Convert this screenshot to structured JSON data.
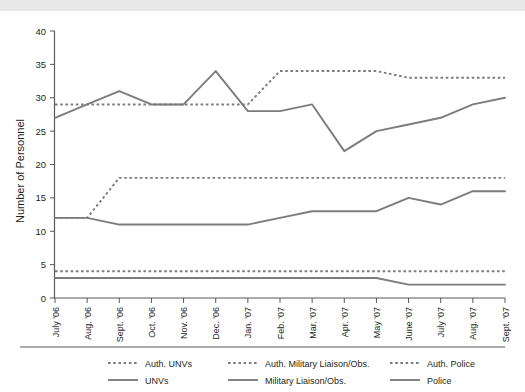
{
  "figure": {
    "background_color": "#ffffff",
    "top_strip_color": "#e8e8e8",
    "line_color": "#7b7c7e",
    "axis_color": "#58595b",
    "text_color": "#231f20"
  },
  "chart_data": {
    "type": "line",
    "title": "",
    "subtitle": "",
    "xlabel": "",
    "ylabel": "Number of Personnel",
    "ylim": [
      0,
      40
    ],
    "ytick_step": 5,
    "yticks": [
      "0",
      "5",
      "10",
      "15",
      "20",
      "25",
      "30",
      "35",
      "40"
    ],
    "grid": false,
    "legend_position": "bottom",
    "categories": [
      "July '06",
      "Aug. '06",
      "Sept. '06",
      "Oct. '06",
      "Nov. '06",
      "Dec. '06",
      "Jan. '07",
      "Feb. '07",
      "Mar. '07",
      "Apr. '07",
      "May '07",
      "June '07",
      "July '07",
      "Aug. '07",
      "Sept. '07"
    ],
    "series": [
      {
        "name": "Auth. UNVs",
        "style": "dashed",
        "values": [
          12,
          12,
          18,
          18,
          18,
          18,
          18,
          18,
          18,
          18,
          18,
          18,
          18,
          18,
          18
        ]
      },
      {
        "name": "Auth. Military Liaison/Obs.",
        "style": "dashed",
        "values": [
          29,
          29,
          29,
          29,
          29,
          29,
          29,
          34,
          34,
          34,
          34,
          33,
          33,
          33,
          33
        ]
      },
      {
        "name": "Auth. Police",
        "style": "dashed",
        "values": [
          4,
          4,
          4,
          4,
          4,
          4,
          4,
          4,
          4,
          4,
          4,
          4,
          4,
          4,
          4
        ]
      },
      {
        "name": "UNVs",
        "style": "solid",
        "values": [
          12,
          12,
          11,
          11,
          11,
          11,
          11,
          12,
          13,
          13,
          13,
          15,
          14,
          16,
          16
        ]
      },
      {
        "name": "Military Liaison/Obs.",
        "style": "solid",
        "values": [
          27,
          29,
          31,
          29,
          29,
          34,
          28,
          28,
          29,
          22,
          25,
          26,
          27,
          29,
          30
        ]
      },
      {
        "name": "Police",
        "style": "solid",
        "values": [
          3,
          3,
          3,
          3,
          3,
          3,
          3,
          3,
          3,
          3,
          3,
          2,
          2,
          2,
          2
        ]
      }
    ]
  },
  "legend": {
    "rows": [
      [
        {
          "label": "Auth. UNVs",
          "style": "dashed"
        },
        {
          "label": "Auth. Military Liaison/Obs.",
          "style": "dashed"
        },
        {
          "label": "Auth. Police",
          "style": "dashed"
        }
      ],
      [
        {
          "label": "UNVs",
          "style": "solid"
        },
        {
          "label": "Military Liaison/Obs.",
          "style": "solid"
        },
        {
          "label": "Police",
          "style": "solid"
        }
      ]
    ]
  }
}
